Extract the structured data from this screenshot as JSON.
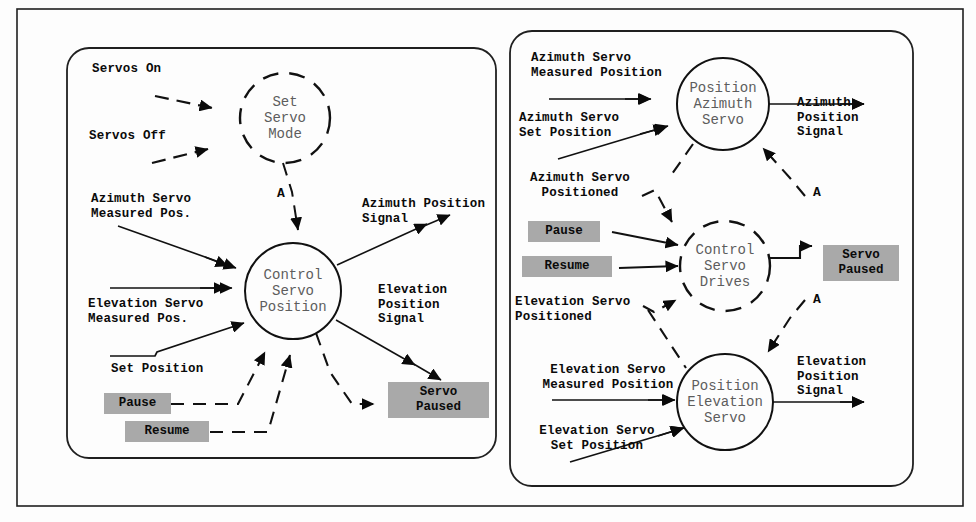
{
  "figure": {
    "outer_frame": "rectangular-border",
    "panel_count": 2
  },
  "colors": {
    "ink": "#0a0a0a",
    "bubble_text": "#5d5d5d",
    "chip_fill": "#a9a9a9",
    "frame": "#202020",
    "paper": "#fdfdfd"
  },
  "left_panel": {
    "processes": [
      {
        "id": "set-servo-mode",
        "label": "Set\nServo\nMode",
        "style": "dashed-circle"
      },
      {
        "id": "control-servo-position",
        "label": "Control\nServo\nPosition",
        "style": "solid-circle"
      }
    ],
    "inputs": [
      {
        "id": "servos-on",
        "label": "Servos On"
      },
      {
        "id": "servos-off",
        "label": "Servos Off"
      },
      {
        "id": "azimuth-measured-pos",
        "label": "Azimuth Servo\nMeasured Pos."
      },
      {
        "id": "elevation-measured-pos",
        "label": "Elevation Servo\nMeasured Pos."
      },
      {
        "id": "set-position",
        "label": "Set Position"
      }
    ],
    "outputs": [
      {
        "id": "azimuth-position-signal",
        "label": "Azimuth Position\nSignal"
      },
      {
        "id": "elevation-position-signal",
        "label": "Elevation\nPosition\nSignal"
      }
    ],
    "chips": [
      {
        "id": "pause",
        "label": "Pause"
      },
      {
        "id": "resume",
        "label": "Resume"
      },
      {
        "id": "servo-paused",
        "label": "Servo\nPaused"
      }
    ],
    "connector_flags": [
      {
        "id": "flag-a-left",
        "label": "A"
      }
    ]
  },
  "right_panel": {
    "processes": [
      {
        "id": "position-azimuth-servo",
        "label": "Position\nAzimuth\nServo",
        "style": "solid-circle"
      },
      {
        "id": "control-servo-drives",
        "label": "Control\nServo\nDrives",
        "style": "dashed-circle"
      },
      {
        "id": "position-elevation-servo",
        "label": "Position\nElevation\nServo",
        "style": "solid-circle"
      }
    ],
    "inputs": [
      {
        "id": "az-measured-position",
        "label": "Azimuth Servo\nMeasured Position"
      },
      {
        "id": "az-set-position",
        "label": "Azimuth Servo\nSet Position"
      },
      {
        "id": "az-positioned",
        "label": "Azimuth Servo\nPositioned"
      },
      {
        "id": "el-positioned",
        "label": "Elevation Servo\nPositioned"
      },
      {
        "id": "el-measured-position",
        "label": "Elevation Servo\nMeasured Position"
      },
      {
        "id": "el-set-position",
        "label": "Elevation Servo\nSet Position"
      }
    ],
    "outputs": [
      {
        "id": "az-position-signal",
        "label": "Azimuth\nPosition\nSignal"
      },
      {
        "id": "el-position-signal",
        "label": "Elevation\nPosition\nSignal"
      }
    ],
    "chips": [
      {
        "id": "pause-r",
        "label": "Pause"
      },
      {
        "id": "resume-r",
        "label": "Resume"
      },
      {
        "id": "servo-paused-r",
        "label": "Servo\nPaused"
      }
    ],
    "connector_flags": [
      {
        "id": "flag-a-top",
        "label": "A"
      },
      {
        "id": "flag-a-bottom",
        "label": "A"
      }
    ]
  }
}
